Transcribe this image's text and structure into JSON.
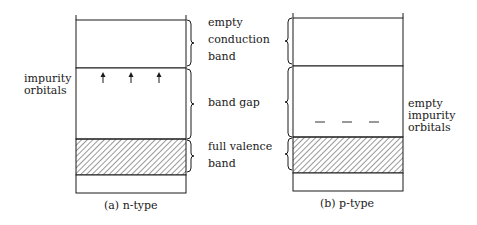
{
  "panels": [
    {
      "id": "n-type",
      "caption": "(a) n-type",
      "impurity_marker": "arrow-up",
      "impurity_count": 3,
      "side_label": [
        "impurity",
        "orbitals"
      ]
    },
    {
      "id": "p-type",
      "caption": "(b) p-type",
      "impurity_marker": "dash",
      "impurity_count": 3,
      "side_label": [
        "empty",
        "impurity",
        "orbitals"
      ]
    }
  ],
  "bands": {
    "conduction": [
      "empty",
      "conduction",
      "band"
    ],
    "gap": [
      "band gap"
    ],
    "valence": [
      "full valence",
      "band"
    ]
  },
  "colors": {
    "line": "#1a1a1a",
    "hatch": "#333333",
    "background": "#ffffff"
  }
}
